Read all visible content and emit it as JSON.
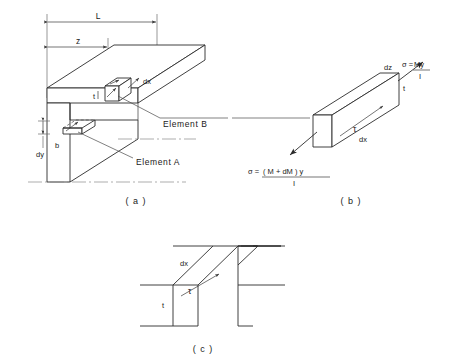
{
  "figure": {
    "title_present": false,
    "panels": [
      {
        "id": "a",
        "label": "( a )"
      },
      {
        "id": "b",
        "label": "( b )"
      },
      {
        "id": "c",
        "label": "( c )"
      }
    ]
  },
  "panel_a": {
    "name": "beam-with-elements",
    "dimensions": [
      {
        "name": "length",
        "label": "L"
      },
      {
        "name": "distance-z",
        "label": "z"
      },
      {
        "name": "element-width-dz",
        "label": "dz"
      },
      {
        "name": "element-depth-dx",
        "label": "dx"
      },
      {
        "name": "thickness-t",
        "label": "t"
      },
      {
        "name": "width-b",
        "label": "b"
      },
      {
        "name": "height-dy",
        "label": "dy"
      }
    ],
    "callouts": [
      {
        "name": "element-b-callout",
        "label": "Element  B"
      },
      {
        "name": "element-a-callout",
        "label": "Element  A"
      }
    ]
  },
  "panel_b": {
    "name": "stress-element-detail",
    "labels": [
      {
        "name": "dz-label",
        "label": "dz"
      },
      {
        "name": "dx-label",
        "label": "dx"
      },
      {
        "name": "t-label",
        "label": "t"
      },
      {
        "name": "tau-label",
        "label": "τ"
      }
    ],
    "formulas": {
      "top_right": {
        "name": "sigma-my-over-i",
        "lhs": "σ =",
        "numerator": "My",
        "denominator": "I"
      },
      "bottom_left": {
        "name": "sigma-m-plus-dm-y-over-i",
        "lhs": "σ =",
        "numerator": "( M + dM ) y",
        "denominator": "I"
      }
    }
  },
  "panel_c": {
    "name": "section-shear-view",
    "labels": [
      {
        "name": "dx-label",
        "label": "dx"
      },
      {
        "name": "t-label",
        "label": "t"
      },
      {
        "name": "tau-label",
        "label": "τ"
      }
    ]
  },
  "style": {
    "line_color": "#2b2b2b",
    "background": "#ffffff",
    "text_color": "#1a1a1a"
  }
}
